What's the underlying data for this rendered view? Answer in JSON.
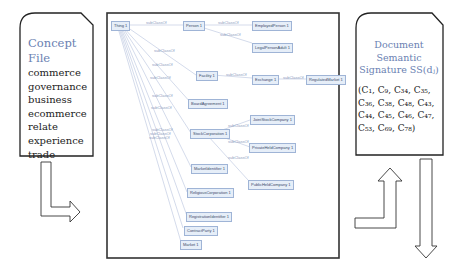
{
  "concept_file": {
    "title_line1": "Concept",
    "title_line2": "File",
    "terms": [
      "commerce",
      "governance",
      "business",
      "ecommerce",
      "relate",
      "experience",
      "trade"
    ]
  },
  "document_signature": {
    "title_line1": "Document",
    "title_line2": "Semantic",
    "title_line3": "Signature SS(dⱼ)",
    "concepts": "(C₁, C₉, C₃₄, C₃₅, C₃₆, C₃₈, C₄₈, C₄₃, C₄₄, C₄₅, C₄₆, C₄₇, C₅₃, C₆₉, C₇₈)"
  },
  "ontology": {
    "edge_label": "subClassOf",
    "nodes": {
      "thing": "Thing 1",
      "person": "Person 1",
      "employed": "EmployedPerson 1",
      "legal": "LegalPersonAdult 1",
      "facility": "Facility 1",
      "exchange": "Exchange 1",
      "regulated": "RegulatedMarket 1",
      "board": "BoardAgreement 1",
      "stock": "StockCorporation 1",
      "joint": "JointStockCompany 1",
      "private": "PrivateHeldCompany 1",
      "public": "PublicHeldCompany 1",
      "market_id": "MarketIdentifier 1",
      "religious": "ReligiousCorporation 1",
      "regis": "RegistrationIdentifier 1",
      "contract": "ContractParty 1",
      "market": "Market 1"
    }
  }
}
